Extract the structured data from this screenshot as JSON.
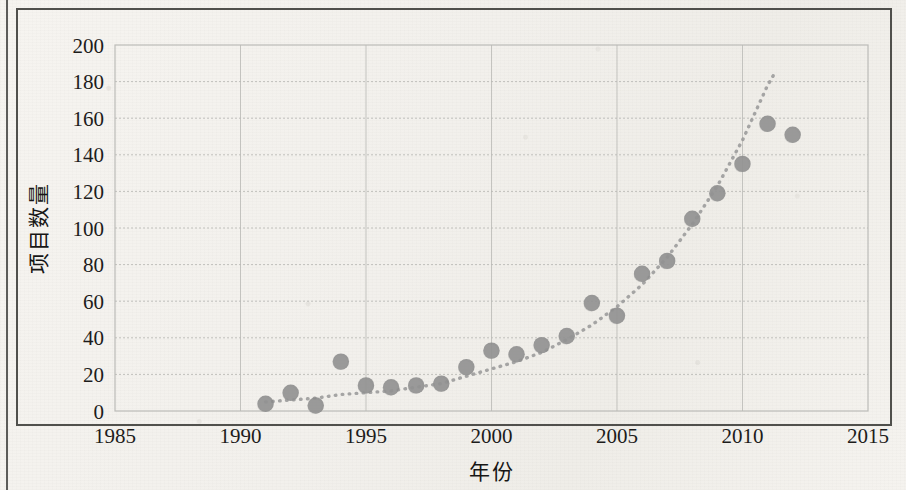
{
  "figure": {
    "axis_y_title": "项目数量",
    "axis_x_title": "年份",
    "y_ticks": [
      "0",
      "20",
      "40",
      "60",
      "80",
      "100",
      "120",
      "140",
      "160",
      "180",
      "200"
    ],
    "x_ticks": [
      "1985",
      "1990",
      "1995",
      "2000",
      "2005",
      "2010",
      "2015"
    ],
    "marker_color": "#8b8b8b",
    "trendline_color": "#9a9a9a",
    "grid_color": "#b9b9b5",
    "frame_color": "#3a3936"
  },
  "chart_data": {
    "type": "scatter",
    "title": "",
    "subtitle": "",
    "xlabel": "年份",
    "ylabel": "项目数量",
    "xlim": [
      1985,
      2015
    ],
    "ylim": [
      0,
      200
    ],
    "xticks": [
      1985,
      1990,
      1995,
      2000,
      2005,
      2010,
      2015
    ],
    "yticks": [
      0,
      20,
      40,
      60,
      80,
      100,
      120,
      140,
      160,
      180,
      200
    ],
    "grid": true,
    "legend": null,
    "series": [
      {
        "name": "项目数量",
        "marker": "circle",
        "color": "#8b8b8b",
        "x": [
          1991,
          1992,
          1993,
          1994,
          1995,
          1996,
          1997,
          1998,
          1999,
          2000,
          2001,
          2002,
          2003,
          2004,
          2005,
          2006,
          2007,
          2008,
          2009,
          2010,
          2011,
          2012
        ],
        "values": [
          4,
          10,
          3,
          27,
          14,
          13,
          14,
          15,
          24,
          33,
          31,
          36,
          41,
          59,
          52,
          75,
          82,
          105,
          119,
          135,
          157,
          151
        ]
      },
      {
        "name": "趋势线",
        "type": "trendline",
        "style": "dotted",
        "color": "#9a9a9a",
        "x": [
          1991,
          1992,
          1993,
          1994,
          1995,
          1996,
          1997,
          1998,
          1999,
          2000,
          2001,
          2002,
          2003,
          2004,
          2005,
          2006,
          2007,
          2008,
          2009,
          2010,
          2011,
          2011.3
        ],
        "values": [
          5,
          6,
          7,
          9,
          10,
          11,
          13,
          15,
          19,
          23,
          27,
          32,
          39,
          47,
          57,
          69,
          84,
          102,
          123,
          148,
          178,
          185
        ]
      }
    ]
  }
}
